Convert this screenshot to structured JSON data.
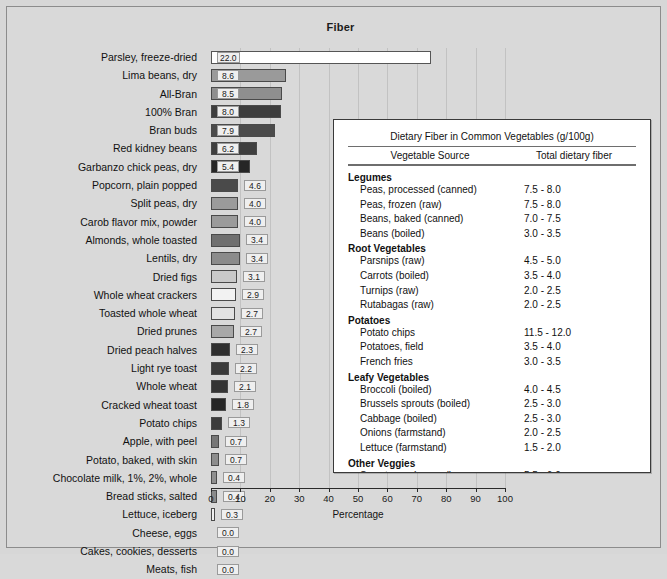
{
  "chart_data": {
    "type": "bar",
    "orientation": "horizontal",
    "title": "Fiber",
    "xlabel": "Percentage",
    "ylabel": "",
    "xlim": [
      0,
      100
    ],
    "xticks": [
      0,
      10,
      20,
      30,
      40,
      50,
      60,
      70,
      80,
      90,
      100
    ],
    "grid": true,
    "legend": "none",
    "categories": [
      "Parsley, freeze-dried",
      "Lima beans, dry",
      "All-Bran",
      "100% Bran",
      "Bran buds",
      "Red kidney beans",
      "Garbanzo chick peas, dry",
      "Popcorn, plain popped",
      "Split peas, dry",
      "Carob flavor mix, powder",
      "Almonds, whole toasted",
      "Lentils, dry",
      "Dried figs",
      "Whole wheat crackers",
      "Toasted whole wheat",
      "Dried prunes",
      "Dried peach halves",
      "Light rye toast",
      "Whole wheat",
      "Cracked wheat toast",
      "Potato chips",
      "Apple, with peel",
      "Potato, baked, with skin",
      "Chocolate milk, 1%, 2%, whole",
      "Bread sticks, salted",
      "Lettuce, iceberg",
      "Cheese, eggs",
      "Cakes, cookies, desserts",
      "Meats, fish"
    ],
    "values": [
      22.0,
      8.6,
      8.5,
      8.0,
      7.9,
      6.2,
      5.4,
      4.6,
      4.0,
      4.0,
      3.4,
      3.4,
      3.1,
      2.9,
      2.7,
      2.7,
      2.3,
      2.2,
      2.1,
      1.8,
      1.3,
      0.7,
      0.7,
      0.4,
      0.4,
      0.3,
      0.0,
      0.0,
      0.0
    ],
    "value_labels": [
      "22.0",
      "8.6",
      "8.5",
      "8.0",
      "7.9",
      "6.2",
      "5.4",
      "4.6",
      "4.0",
      "4.0",
      "3.4",
      "3.4",
      "3.1",
      "2.9",
      "2.7",
      "2.7",
      "2.3",
      "2.2",
      "2.1",
      "1.8",
      "1.3",
      "0.7",
      "0.7",
      "0.4",
      "0.4",
      "0.3",
      "0.0",
      "0.0",
      "0.0"
    ],
    "bar_pixel_widths": [
      220,
      75,
      71,
      70,
      64,
      46,
      39,
      27,
      27,
      27,
      29,
      29,
      26,
      25,
      24,
      23,
      19,
      18,
      17,
      15,
      11,
      8,
      8,
      6,
      6,
      4,
      0,
      0,
      0
    ],
    "bar_colors": [
      "#ffffff",
      "#9a9a9a",
      "#8f8f8f",
      "#3d3d3d",
      "#4b4b4b",
      "#3f3f3f",
      "#262626",
      "#4a4a4a",
      "#9b9b9b",
      "#9b9b9b",
      "#6f6f6f",
      "#8b8b8b",
      "#c9c9c9",
      "#f2f2f2",
      "#e2e2e2",
      "#a8a8a8",
      "#2e2e2e",
      "#3a3a3a",
      "#343434",
      "#262626",
      "#3c3c3c",
      "#777777",
      "#8c8c8c",
      "#8f8f8f",
      "#8a8a8a",
      "#f0f0f0",
      "#ffffff",
      "#ffffff",
      "#ffffff"
    ]
  },
  "table": {
    "title": "Dietary Fiber in Common Vegetables (g/100g)",
    "columns": [
      "Vegetable Source",
      "Total dietary fiber"
    ],
    "groups": [
      {
        "name": "Legumes",
        "rows": [
          {
            "name": "Peas, processed (canned)",
            "value": "7.5 - 8.0"
          },
          {
            "name": "Peas, frozen (raw)",
            "value": "7.5 - 8.0"
          },
          {
            "name": "Beans, baked (canned)",
            "value": "7.0 - 7.5"
          },
          {
            "name": "Beans (boiled)",
            "value": "3.0 - 3.5"
          }
        ]
      },
      {
        "name": "Root Vegetables",
        "rows": [
          {
            "name": "Parsnips (raw)",
            "value": "4.5 - 5.0"
          },
          {
            "name": "Carrots (boiled)",
            "value": "3.5 - 4.0"
          },
          {
            "name": "Turnips (raw)",
            "value": "2.0 - 2.5"
          },
          {
            "name": "Rutabagas (raw)",
            "value": "2.0 - 2.5"
          }
        ]
      },
      {
        "name": "Potatoes",
        "rows": [
          {
            "name": "Potato chips",
            "value": "11.5 - 12.0"
          },
          {
            "name": "Potatoes, field",
            "value": "3.5 - 4.0"
          },
          {
            "name": "French fries",
            "value": "3.0 - 3.5"
          }
        ]
      },
      {
        "name": "Leafy Vegetables",
        "rows": [
          {
            "name": "Broccoli (boiled)",
            "value": "4.0 - 4.5"
          },
          {
            "name": "Brussels sprouts (boiled)",
            "value": "2.5 - 3.0"
          },
          {
            "name": "Cabbage (boiled)",
            "value": "2.5 - 3.0"
          },
          {
            "name": "Onions (farmstand)",
            "value": "2.0 - 2.5"
          },
          {
            "name": "Lettuce (farmstand)",
            "value": "1.5 - 2.0"
          }
        ]
      },
      {
        "name": "Other Veggies",
        "rows": [
          {
            "name": "Sweet corn (canned)",
            "value": "5.5 - 6.0"
          },
          {
            "name": "Sweet corn (cooked)",
            "value": "4.5 - 6.0"
          },
          {
            "name": "Tomatoes (field)",
            "value": "1.0 - 1.5"
          },
          {
            "name": "Tomatoes (canned)",
            "value": "0.5 - 1.0"
          }
        ]
      }
    ]
  },
  "colors": {
    "background": "#d9d9d9",
    "frame": "#8c8c8c",
    "axis": "#2a2a2a",
    "grid": "#c2c2c2",
    "panel_bg": "#ffffff"
  }
}
